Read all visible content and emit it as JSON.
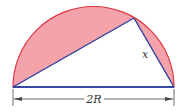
{
  "diagram": {
    "labels": {
      "side": "x",
      "diameter": "2R"
    },
    "colors": {
      "fill": "#f4a3ab",
      "arc": "#e0343f",
      "triangle": "#2a3f9e",
      "dimension": "#444444"
    }
  }
}
